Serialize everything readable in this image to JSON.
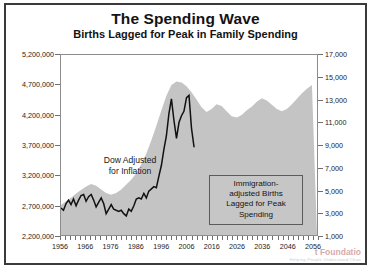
{
  "header": {
    "title": "The Spending Wave",
    "subtitle": "Births Lagged for Peak in Family Spending"
  },
  "annotations": {
    "dow_label_line1": "Dow Adjusted",
    "dow_label_line2": "for Inflation",
    "births_box_line1": "Immigration-",
    "births_box_line2": "adjusted Births",
    "births_box_line3": "Lagged for Peak",
    "births_box_line4": "Spending"
  },
  "watermark": {
    "line1": "t Foundatio",
    "line2": "Helping People Understand Chan"
  },
  "colors": {
    "frame": "#3a3a3a",
    "plot_border": "#8d8d8d",
    "births_area": "#c4c4c4",
    "dow_line": "#111111",
    "text": "#131313"
  },
  "chart_data": {
    "type": "area",
    "title": "The Spending Wave",
    "subtitle": "Births Lagged for Peak in Family Spending",
    "xlabel": "",
    "ylabel": "",
    "grid": false,
    "legend": "none",
    "xlim": [
      1956,
      2058
    ],
    "x_ticks_labeled": [
      1956,
      1966,
      1976,
      1986,
      1996,
      2006,
      2016,
      2026,
      2036,
      2046,
      2056
    ],
    "x_tick_interval_minor": 2,
    "axes": {
      "left": {
        "name": "Immigration-adjusted Births Lagged for Peak Spending",
        "ylim": [
          2200000,
          5200000
        ],
        "ticks": [
          2200000,
          2700000,
          3200000,
          3700000,
          4200000,
          4700000,
          5200000
        ],
        "tick_labels": [
          "2,200,000",
          "2,700,000",
          "3,200,000",
          "3,700,000",
          "4,200,000",
          "4,700,000",
          "5,200,000"
        ]
      },
      "right": {
        "name": "Dow Adjusted for Inflation",
        "ylim": [
          1000,
          17000
        ],
        "ticks": [
          1000,
          3000,
          5000,
          7000,
          9000,
          11000,
          13000,
          15000,
          17000
        ],
        "tick_labels": [
          "1,000",
          "3,000",
          "5,000",
          "7,000",
          "9,000",
          "11,000",
          "13,000",
          "15,000",
          "17,000"
        ]
      }
    },
    "series": [
      {
        "name": "Immigration-adjusted Births Lagged for Peak Spending",
        "axis": "left",
        "type": "area",
        "color": "#c4c4c4",
        "x": [
          1956,
          1958,
          1960,
          1962,
          1964,
          1966,
          1968,
          1970,
          1972,
          1974,
          1976,
          1978,
          1980,
          1982,
          1984,
          1986,
          1988,
          1990,
          1992,
          1994,
          1996,
          1998,
          2000,
          2002,
          2004,
          2006,
          2008,
          2010,
          2012,
          2014,
          2016,
          2018,
          2020,
          2022,
          2024,
          2026,
          2028,
          2030,
          2032,
          2034,
          2036,
          2038,
          2040,
          2042,
          2044,
          2046,
          2048,
          2050,
          2052,
          2054,
          2056
        ],
        "y": [
          2700000,
          2760000,
          2820000,
          2890000,
          2950000,
          3010000,
          3050000,
          3020000,
          2960000,
          2900000,
          2870000,
          2900000,
          2960000,
          3040000,
          3120000,
          3230000,
          3380000,
          3560000,
          3780000,
          4020000,
          4280000,
          4520000,
          4700000,
          4760000,
          4740000,
          4680000,
          4580000,
          4460000,
          4330000,
          4250000,
          4300000,
          4380000,
          4350000,
          4260000,
          4180000,
          4160000,
          4200000,
          4280000,
          4340000,
          4420000,
          4480000,
          4440000,
          4370000,
          4300000,
          4260000,
          4300000,
          4380000,
          4470000,
          4560000,
          4640000,
          4700000
        ]
      },
      {
        "name": "Dow Adjusted for Inflation",
        "axis": "right",
        "type": "line",
        "color": "#111111",
        "x": [
          1956,
          1957,
          1958,
          1959,
          1960,
          1961,
          1962,
          1963,
          1964,
          1965,
          1966,
          1967,
          1968,
          1969,
          1970,
          1971,
          1972,
          1973,
          1974,
          1975,
          1976,
          1977,
          1978,
          1979,
          1980,
          1981,
          1982,
          1983,
          1984,
          1985,
          1986,
          1987,
          1988,
          1989,
          1990,
          1991,
          1992,
          1993,
          1994,
          1995,
          1996,
          1997,
          1998,
          1999,
          2000,
          2001,
          2002,
          2003,
          2004,
          2005,
          2006,
          2007,
          2008,
          2009
        ],
        "y": [
          3400,
          3200,
          3800,
          4100,
          3700,
          4200,
          3600,
          4100,
          4500,
          4600,
          4000,
          4400,
          4600,
          4100,
          3500,
          3900,
          4300,
          3800,
          2900,
          3300,
          3700,
          3300,
          3200,
          3100,
          3200,
          2900,
          2700,
          3300,
          3100,
          3600,
          4200,
          4300,
          4200,
          4700,
          4300,
          4900,
          5100,
          5300,
          5200,
          6200,
          7200,
          8600,
          9800,
          11800,
          13100,
          11200,
          9600,
          11000,
          11600,
          12000,
          13200,
          13400,
          10500,
          8800
        ]
      }
    ],
    "notes": [
      "Dow Adjusted for Inflation",
      "Immigration-adjusted Births Lagged for Peak Spending"
    ]
  }
}
